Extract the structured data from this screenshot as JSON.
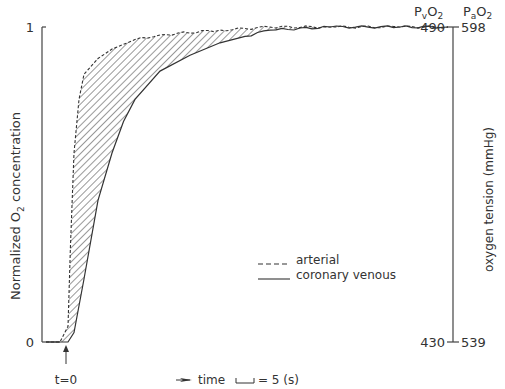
{
  "chart_data": {
    "type": "line",
    "title": "",
    "xlabel": "time",
    "time_scale_label": "= 5 (s)",
    "t0_label": "t=0",
    "ylabel_left": "Normalized O2 concentration",
    "ylabel_left_parts": {
      "pre": "Normalized O",
      "sub": "2",
      "post": " concentration"
    },
    "ylabel_right": "oxygen tension (mmHg)",
    "ylim": [
      0,
      1
    ],
    "left_ticks": [
      "0",
      "1"
    ],
    "right_axes": [
      {
        "name": "PvO2",
        "label_main": "P",
        "label_sub1": "v",
        "label_mid": "O",
        "label_sub2": "2",
        "bottom": "430",
        "top": "490"
      },
      {
        "name": "PaO2",
        "label_main": "P",
        "label_sub1": "a",
        "label_mid": "O",
        "label_sub2": "2",
        "bottom": "539",
        "top": "598"
      }
    ],
    "x_units": "seconds (approx, 1 tick unit = 5 s)",
    "series": [
      {
        "name": "arterial",
        "style": "dashed",
        "x": [
          0,
          1,
          2,
          2.5,
          2.7,
          3,
          3.5,
          4,
          5,
          6,
          8,
          10,
          14,
          20,
          30,
          45,
          60
        ],
        "y": [
          0.0,
          0.0,
          0.0,
          0.05,
          0.3,
          0.6,
          0.77,
          0.85,
          0.9,
          0.93,
          0.96,
          0.975,
          0.99,
          1.0,
          1.0,
          1.0,
          1.0
        ]
      },
      {
        "name": "coronary venous",
        "style": "solid",
        "x": [
          0,
          1,
          2,
          2.5,
          3,
          4,
          5,
          6,
          7,
          8,
          10,
          12,
          14,
          16,
          20,
          30,
          45,
          60
        ],
        "y": [
          0.0,
          0.0,
          0.0,
          0.0,
          0.03,
          0.2,
          0.45,
          0.6,
          0.7,
          0.77,
          0.86,
          0.91,
          0.95,
          0.97,
          0.99,
          1.0,
          1.0,
          1.0
        ]
      }
    ],
    "shaded_region": "between arterial and coronary venous curves (hatched)",
    "legend": [
      {
        "label": "arterial",
        "style": "dashed"
      },
      {
        "label": "coronary venous",
        "style": "solid"
      }
    ],
    "legend_position": "lower-right"
  }
}
